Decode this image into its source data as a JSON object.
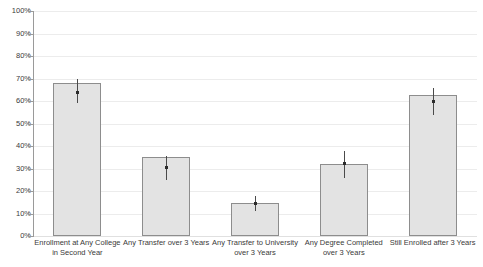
{
  "chart_data": {
    "type": "bar",
    "title": "",
    "xlabel": "",
    "ylabel": "",
    "ylim": [
      0,
      100
    ],
    "ytick_labels": [
      "100%",
      "90%",
      "80%",
      "70%",
      "60%",
      "50%",
      "40%",
      "30%",
      "20%",
      "10%",
      "0%"
    ],
    "ytick_values": [
      100,
      90,
      80,
      70,
      60,
      50,
      40,
      30,
      20,
      10,
      0
    ],
    "grid": true,
    "legend": "none",
    "units": "percent",
    "categories": [
      "Enrollment at Any College in Second Year",
      "Any Transfer over 3 Years",
      "Any Transfer to University over 3 Years",
      "Any Degree Completed over 3 Years",
      "Still Enrolled after 3 Years"
    ],
    "category_lines": [
      {
        "line1": "Enrollment at Any College",
        "line2": "in Second Year"
      },
      {
        "line1": "Any Transfer over 3 Years",
        "line2": ""
      },
      {
        "line1": "Any Transfer to University",
        "line2": "over 3 Years"
      },
      {
        "line1": "Any Degree Completed",
        "line2": "over 3 Years"
      },
      {
        "line1": "Still Enrolled after 3 Years",
        "line2": ""
      }
    ],
    "values": [
      68,
      35,
      14.5,
      32,
      62.5
    ],
    "error_low": [
      59,
      25,
      11,
      26,
      54
    ],
    "error_high": [
      70,
      35.5,
      18,
      38,
      66
    ],
    "error_marker": [
      64,
      30.5,
      14.5,
      32.5,
      60
    ],
    "colors": {
      "bar_fill": "#e3e3e3",
      "bar_border": "#8d8d8d",
      "gridline": "#ececec",
      "axis": "#9a9a9a",
      "error": "#4a4a4a",
      "text": "#3a3a3a",
      "background": "#ffffff"
    }
  }
}
